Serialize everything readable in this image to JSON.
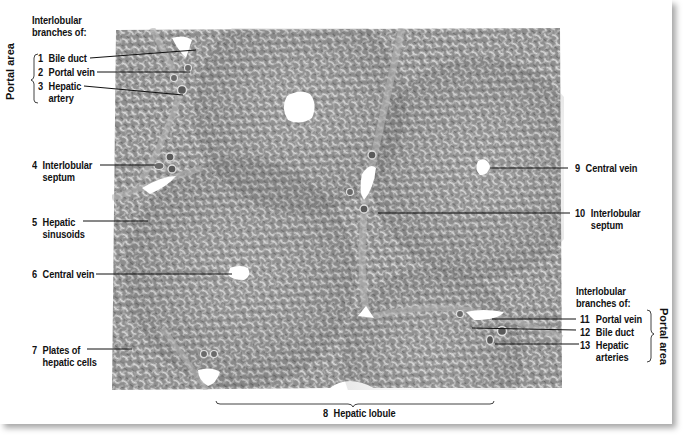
{
  "figure": {
    "bottom_label": {
      "num": "8",
      "text": "Hepatic lobule"
    }
  },
  "left_group": {
    "heading_line1": "Interlobular",
    "heading_line2": "branches of:",
    "bracket_label": "Portal area",
    "items": [
      {
        "num": "1",
        "line1": "Bile duct",
        "line2": ""
      },
      {
        "num": "2",
        "line1": "Portal vein",
        "line2": ""
      },
      {
        "num": "3",
        "line1": "Hepatic",
        "line2": "artery"
      }
    ]
  },
  "left_labels": [
    {
      "num": "4",
      "line1": "Interlobular",
      "line2": "septum"
    },
    {
      "num": "5",
      "line1": "Hepatic",
      "line2": "sinusoids"
    },
    {
      "num": "6",
      "line1": "Central vein",
      "line2": ""
    },
    {
      "num": "7",
      "line1": "Plates of",
      "line2": "hepatic cells"
    }
  ],
  "right_labels": [
    {
      "num": "9",
      "line1": "Central vein",
      "line2": ""
    },
    {
      "num": "10",
      "line1": "Interlobular",
      "line2": "septum"
    }
  ],
  "right_group": {
    "heading_line1": "Interlobular",
    "heading_line2": "branches of:",
    "bracket_label": "Portal area",
    "items": [
      {
        "num": "11",
        "line1": "Portal vein",
        "line2": ""
      },
      {
        "num": "12",
        "line1": "Bile duct",
        "line2": ""
      },
      {
        "num": "13",
        "line1": "Hepatic",
        "line2": "arteries"
      }
    ]
  },
  "colors": {
    "tissue_base": "#8c8c8c",
    "tissue_light": "#d9d9d9",
    "label_text": "#111111",
    "leader_line": "#111111",
    "lumen": "#ffffff"
  }
}
